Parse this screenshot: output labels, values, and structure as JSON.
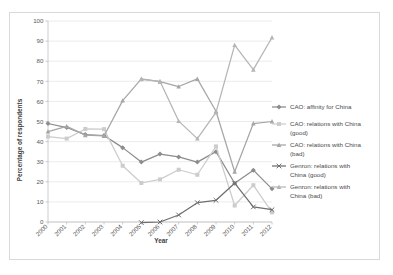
{
  "chart_data": {
    "type": "line",
    "title": "",
    "xlabel": "Year",
    "ylabel": "Percentage of respondents",
    "categories": [
      "2000",
      "2001",
      "2002",
      "2003",
      "2004",
      "2005",
      "2006",
      "2007",
      "2008",
      "2009",
      "2010",
      "2011",
      "2012"
    ],
    "x": [
      2000,
      2001,
      2002,
      2003,
      2004,
      2005,
      2006,
      2007,
      2008,
      2009,
      2010,
      2011,
      2012
    ],
    "xlim": [
      2000,
      2012
    ],
    "ylim": [
      0,
      100
    ],
    "yticks": [
      0,
      10,
      20,
      30,
      40,
      50,
      60,
      70,
      80,
      90,
      100
    ],
    "grid": "horizontal",
    "legend_position": "right",
    "series": [
      {
        "name": "CAO: affinity for China",
        "color": "#8c8c8c",
        "marker": "diamond",
        "values": [
          49.0,
          47.0,
          43.5,
          43.0,
          37.0,
          29.8,
          33.8,
          32.4,
          29.8,
          35.0,
          19.3,
          25.8,
          16.5
        ]
      },
      {
        "name": "CAO: relations with China (good)",
        "color": "#cccccc",
        "marker": "square",
        "values": [
          42.5,
          41.5,
          46.3,
          46.2,
          28.0,
          19.4,
          21.2,
          26.0,
          23.5,
          37.6,
          8.2,
          18.3,
          4.8
        ]
      },
      {
        "name": "CAO: relations with China (bad)",
        "color": "#a6a6a6",
        "marker": "triangle",
        "values": [
          45.0,
          47.6,
          43.2,
          42.8,
          60.4,
          71.2,
          69.8,
          67.4,
          71.2,
          55.1,
          25.0,
          49.0,
          50.0
        ]
      },
      {
        "name": "Genron: relations with China (good)",
        "color": "#6e6e6e",
        "marker": "cross",
        "values": [
          null,
          null,
          null,
          null,
          null,
          -0.3,
          0.0,
          3.5,
          9.6,
          10.8,
          19.3,
          7.5,
          6.1
        ]
      },
      {
        "name": "Genron: relations with China (bad)",
        "color": "#b5b5b5",
        "marker": "triangle",
        "values": [
          null,
          null,
          null,
          null,
          null,
          71.0,
          70.0,
          50.2,
          41.5,
          54.5,
          88.0,
          75.8,
          91.8
        ]
      }
    ]
  },
  "legend": {
    "items": [
      "CAO: affinity for China",
      "CAO: relations with China (good)",
      "CAO: relations with China (bad)",
      "Genron: relations with China (good)",
      "Genron: relations with China (bad)"
    ],
    "wrapped": [
      [
        "CAO: affinity for China"
      ],
      [
        "CAO: relations with China",
        "(good)"
      ],
      [
        "CAO: relations with China",
        "(bad)"
      ],
      [
        "Genron: relations with",
        "China (good)"
      ],
      [
        "Genron: relations with",
        "China (bad)"
      ]
    ]
  }
}
